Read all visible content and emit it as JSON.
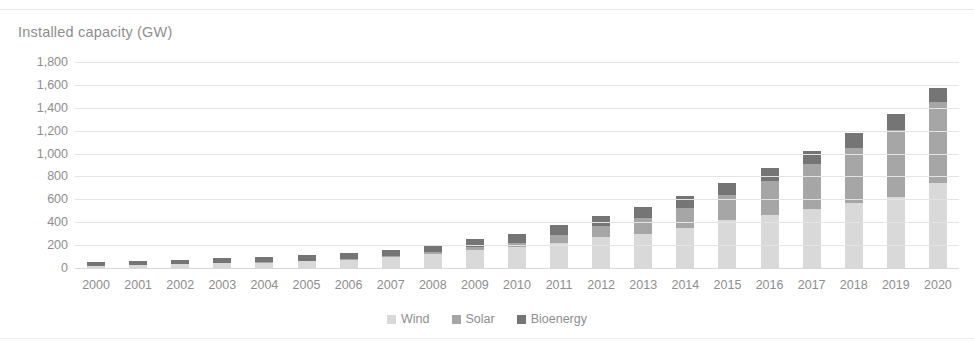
{
  "chart_data": {
    "type": "bar",
    "subtype": "stacked-column",
    "title": "Installed capacity (GW)",
    "xlabel": "",
    "ylabel": "",
    "ylim": [
      0,
      1800
    ],
    "ytick_step": 200,
    "ytick_labels": [
      "1,800",
      "1,600",
      "1,400",
      "1,200",
      "1,000",
      "800",
      "600",
      "400",
      "200",
      "0"
    ],
    "ytick_values": [
      1800,
      1600,
      1400,
      1200,
      1000,
      800,
      600,
      400,
      200,
      0
    ],
    "grid": true,
    "legend_position": "bottom",
    "categories": [
      "2000",
      "2001",
      "2002",
      "2003",
      "2004",
      "2005",
      "2006",
      "2007",
      "2008",
      "2009",
      "2010",
      "2011",
      "2012",
      "2013",
      "2014",
      "2015",
      "2016",
      "2017",
      "2018",
      "2019",
      "2020"
    ],
    "series": [
      {
        "name": "Wind",
        "color": "#d9d9d9",
        "values": [
          17,
          24,
          31,
          40,
          47,
          59,
          74,
          94,
          121,
          159,
          181,
          220,
          267,
          300,
          350,
          417,
          467,
          514,
          564,
          622,
          743
        ]
      },
      {
        "name": "Solar",
        "color": "#a6a6a6",
        "values": [
          1,
          1,
          2,
          3,
          4,
          5,
          6,
          9,
          15,
          23,
          40,
          72,
          102,
          138,
          178,
          222,
          297,
          393,
          486,
          587,
          707
        ]
      },
      {
        "name": "Bioenergy",
        "color": "#757575",
        "values": [
          35,
          38,
          40,
          43,
          47,
          50,
          53,
          58,
          63,
          68,
          74,
          80,
          87,
          94,
          101,
          108,
          114,
          120,
          126,
          133,
          125
        ]
      }
    ],
    "totals": [
      53,
      63,
      73,
      86,
      98,
      114,
      133,
      161,
      199,
      250,
      295,
      372,
      456,
      532,
      629,
      747,
      878,
      1027,
      1176,
      1342,
      1575
    ]
  },
  "legend": {
    "items": [
      {
        "label": "Wind",
        "swatch": "legend-swatch-wind"
      },
      {
        "label": "Solar",
        "swatch": "legend-swatch-solar"
      },
      {
        "label": "Bioenergy",
        "swatch": "legend-swatch-bioenergy"
      }
    ]
  }
}
